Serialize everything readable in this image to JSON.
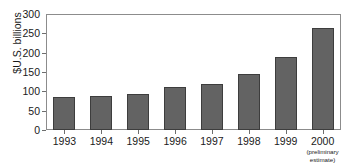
{
  "chart_data": {
    "type": "bar",
    "title": "",
    "xlabel": "",
    "ylabel": "$U.S. billions",
    "ylim": [
      0,
      300
    ],
    "yticks": [
      0,
      50,
      100,
      150,
      200,
      250,
      300
    ],
    "ytick_labels": [
      "0",
      "50",
      "100",
      "150",
      "200",
      "250",
      "300"
    ],
    "grid": false,
    "legend": null,
    "categories": [
      "1993",
      "1994",
      "1995",
      "1996",
      "1997",
      "1998",
      "1999",
      "2000"
    ],
    "category_sublabels": [
      "",
      "",
      "",
      "",
      "",
      "",
      "",
      "(preliminary estimate)"
    ],
    "values": [
      85,
      89,
      94,
      111,
      119,
      145,
      190,
      265
    ],
    "bar_color": "#636363",
    "bar_edge_color": "#3d3d3d",
    "axis_color": "#8c8c8c",
    "text_color": "#1a1a1a",
    "background_color": "#ffffff"
  },
  "axis": {
    "y_title": "$U.S. billions"
  },
  "xlabels": [
    {
      "year": "1993",
      "sub_line1": "",
      "sub_line2": ""
    },
    {
      "year": "1994",
      "sub_line1": "",
      "sub_line2": ""
    },
    {
      "year": "1995",
      "sub_line1": "",
      "sub_line2": ""
    },
    {
      "year": "1996",
      "sub_line1": "",
      "sub_line2": ""
    },
    {
      "year": "1997",
      "sub_line1": "",
      "sub_line2": ""
    },
    {
      "year": "1998",
      "sub_line1": "",
      "sub_line2": ""
    },
    {
      "year": "1999",
      "sub_line1": "",
      "sub_line2": ""
    },
    {
      "year": "2000",
      "sub_line1": "(preliminary",
      "sub_line2": "estimate)"
    }
  ]
}
